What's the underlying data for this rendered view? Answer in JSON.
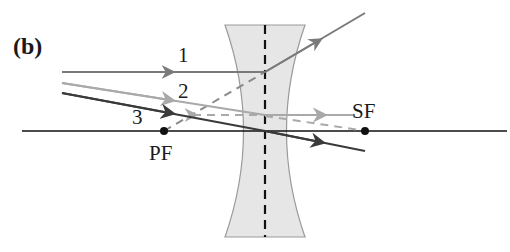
{
  "figure": {
    "panel_label": "(b)",
    "colors": {
      "ray1": "#7a7a7a",
      "ray2": "#a9a9a9",
      "ray3": "#3a3a3a",
      "axis": "#111111",
      "lens_fill": "#e6e6e6",
      "lens_edge": "#9a9a9a",
      "dashed": "#8a8a8a"
    },
    "rays": [
      {
        "label": "1",
        "description": "parallel to axis, refracts as if from PF"
      },
      {
        "label": "2",
        "description": "directed toward SF, emerges parallel to axis"
      },
      {
        "label": "3",
        "description": "through lens center, undeviated"
      }
    ],
    "points": {
      "primary_focus": "PF",
      "secondary_focus": "SF"
    }
  }
}
